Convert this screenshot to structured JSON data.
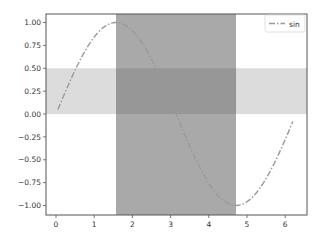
{
  "chart_data": {
    "type": "line",
    "title": "",
    "xlabel": "",
    "ylabel": "",
    "xlim": [
      -0.2,
      6.6
    ],
    "ylim": [
      -1.1,
      1.1
    ],
    "grid": false,
    "legend_position": "upper right",
    "x_ticks": [
      0,
      1,
      2,
      3,
      4,
      5,
      6
    ],
    "x_tick_labels": [
      "0",
      "1",
      "2",
      "3",
      "4",
      "5",
      "6"
    ],
    "y_ticks": [
      1.0,
      0.75,
      0.5,
      0.25,
      0.0,
      -0.25,
      -0.5,
      -0.75,
      -1.0
    ],
    "y_tick_labels": [
      "1.00",
      "0.75",
      "0.50",
      "0.25",
      "0.00",
      "−0.25",
      "−0.50",
      "−0.75",
      "−1.00"
    ],
    "series": [
      {
        "name": "sin",
        "function": "sin(x)",
        "x_start": 0.05,
        "x_end": 6.2,
        "line_style": "dash-dot",
        "color": "#999999",
        "sample_points": [
          {
            "x": 0.05,
            "y": 0.05
          },
          {
            "x": 0.5,
            "y": 0.48
          },
          {
            "x": 1.0,
            "y": 0.84
          },
          {
            "x": 1.5708,
            "y": 1.0
          },
          {
            "x": 2.0,
            "y": 0.91
          },
          {
            "x": 2.5,
            "y": 0.6
          },
          {
            "x": 3.1416,
            "y": 0.0
          },
          {
            "x": 3.5,
            "y": -0.35
          },
          {
            "x": 4.0,
            "y": -0.76
          },
          {
            "x": 4.7124,
            "y": -1.0
          },
          {
            "x": 5.0,
            "y": -0.96
          },
          {
            "x": 5.5,
            "y": -0.71
          },
          {
            "x": 6.0,
            "y": -0.28
          },
          {
            "x": 6.2,
            "y": -0.08
          }
        ]
      }
    ],
    "shaded_regions": [
      {
        "orientation": "vertical",
        "x_from": 1.5708,
        "x_to": 4.7124,
        "color": "#808080",
        "alpha": 0.65
      },
      {
        "orientation": "horizontal",
        "y_from": 0.0,
        "y_to": 0.5,
        "color": "#b0b0b0",
        "alpha": 0.5
      }
    ],
    "legend": [
      {
        "label": "sin",
        "line_style": "dash-dot",
        "color": "#999999"
      }
    ]
  },
  "legend": {
    "sin_label": "sin"
  }
}
